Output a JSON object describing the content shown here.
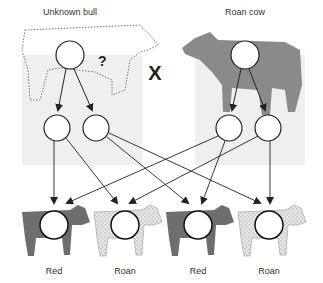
{
  "parents": {
    "left": {
      "label": "Unknown bull",
      "question_mark": "?"
    },
    "right": {
      "label": "Roan cow"
    },
    "cross_symbol": "X"
  },
  "offspring": [
    {
      "label": "Red",
      "phenotype": "red",
      "color": "#6e6e6e"
    },
    {
      "label": "Roan",
      "phenotype": "roan",
      "color": "#e2e2e2"
    },
    {
      "label": "Red",
      "phenotype": "red",
      "color": "#6e6e6e"
    },
    {
      "label": "Roan",
      "phenotype": "roan",
      "color": "#e2e2e2"
    }
  ],
  "colors": {
    "panel_bg": "#efefef",
    "arrow": "#222222",
    "circle_stroke": "#222222",
    "red_calf": "#6e6e6e",
    "roan_calf": "#e2e2e2",
    "cow_body": "#8a8a8a"
  }
}
